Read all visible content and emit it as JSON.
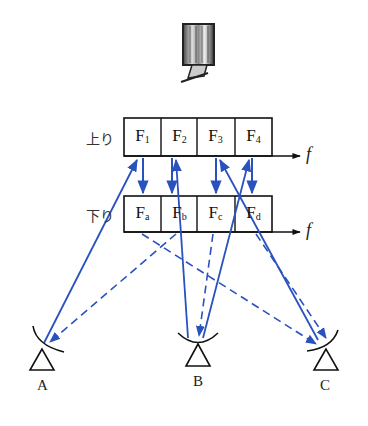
{
  "diagram": {
    "satellite": {
      "name": "communication satellite"
    },
    "uplink": {
      "band_label": "上り",
      "axis_label": "f",
      "channels": [
        {
          "main": "F",
          "sub": "1"
        },
        {
          "main": "F",
          "sub": "2"
        },
        {
          "main": "F",
          "sub": "3"
        },
        {
          "main": "F",
          "sub": "4"
        }
      ]
    },
    "downlink": {
      "band_label": "下り",
      "axis_label": "f",
      "channels": [
        {
          "main": "F",
          "sub": "a"
        },
        {
          "main": "F",
          "sub": "b"
        },
        {
          "main": "F",
          "sub": "c"
        },
        {
          "main": "F",
          "sub": "d"
        }
      ]
    },
    "stations": [
      {
        "label": "A"
      },
      {
        "label": "B"
      },
      {
        "label": "C"
      }
    ],
    "colors": {
      "link": "#2a52be",
      "outline": "#111111"
    },
    "legend_hint": {
      "solid": "uplink signal",
      "dashed": "downlink signal"
    }
  }
}
